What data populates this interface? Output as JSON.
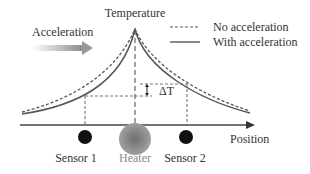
{
  "diagram": {
    "y_axis_label": "Temperature",
    "x_axis_label": "Position",
    "acceleration_label": "Acceleration",
    "delta_label": "ΔT",
    "legend": [
      {
        "label": "No acceleration",
        "style": "dashed"
      },
      {
        "label": "With acceleration",
        "style": "solid"
      }
    ],
    "components": [
      {
        "label": "Sensor 1",
        "type": "sensor"
      },
      {
        "label": "Heater",
        "type": "heater"
      },
      {
        "label": "Sensor 2",
        "type": "sensor"
      }
    ],
    "colors": {
      "line": "#555555",
      "sensor": "#111111",
      "heater_outer": "#9a9a9a",
      "heater_inner": "#7a7a7a",
      "arrow_gradient_start": "#ffffff",
      "arrow_gradient_end": "#888888"
    }
  }
}
